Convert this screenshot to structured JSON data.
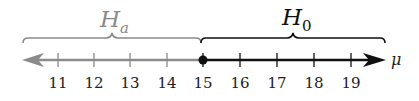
{
  "diagram": {
    "type": "number_line",
    "variable": "μ",
    "ticks": [
      "11",
      "12",
      "13",
      "14",
      "15",
      "16",
      "17",
      "18",
      "19"
    ],
    "point": {
      "value": "15",
      "style": "closed"
    },
    "regions": [
      {
        "name": "H_a",
        "label_main": "H",
        "label_sub": "a",
        "range": "μ < 15",
        "color": "#8a8a8a",
        "direction": "left"
      },
      {
        "name": "H_0",
        "label_main": "H",
        "label_sub": "0",
        "range": "μ ≥ 15",
        "color": "#111111",
        "direction": "right"
      }
    ]
  },
  "colors": {
    "gray": "#8a8a8a",
    "black": "#111111"
  }
}
